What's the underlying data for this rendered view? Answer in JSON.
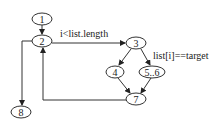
{
  "diagram": {
    "type": "control-flow-graph",
    "nodes": [
      {
        "id": "1",
        "label": "1"
      },
      {
        "id": "2",
        "label": "2"
      },
      {
        "id": "3",
        "label": "3"
      },
      {
        "id": "4",
        "label": "4"
      },
      {
        "id": "5_6",
        "label": "5..6"
      },
      {
        "id": "7",
        "label": "7"
      },
      {
        "id": "8",
        "label": "8"
      }
    ],
    "edges": [
      {
        "from": "1",
        "to": "2"
      },
      {
        "from": "2",
        "to": "3",
        "label": "i<list.length"
      },
      {
        "from": "2",
        "to": "8"
      },
      {
        "from": "3",
        "to": "4"
      },
      {
        "from": "3",
        "to": "5_6",
        "label": "list[i]==target"
      },
      {
        "from": "4",
        "to": "7"
      },
      {
        "from": "5_6",
        "to": "7"
      },
      {
        "from": "7",
        "to": "2"
      }
    ],
    "edge_labels": {
      "loop_condition": "i<list.length",
      "branch_condition": "list[i]==target"
    }
  }
}
